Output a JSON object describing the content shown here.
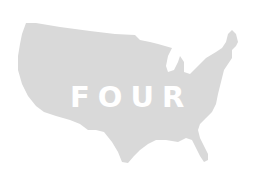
{
  "image": {
    "subject": "map of the contiguous United States",
    "label": "FOUR",
    "colors": {
      "background": "#ffffff",
      "map_fill": "#d9d9d9",
      "label": "#ffffff"
    }
  }
}
